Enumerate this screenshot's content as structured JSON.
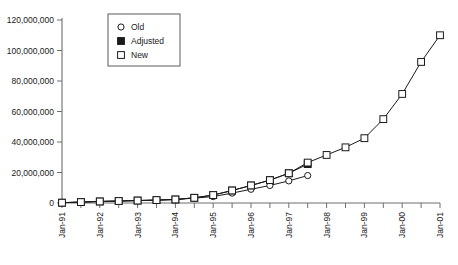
{
  "chart_data": {
    "type": "line",
    "title": "",
    "subtitle": "",
    "xlabel": "",
    "ylabel": "",
    "grid": false,
    "legend_position": "upper-left-inside",
    "ylim": [
      0,
      120000000
    ],
    "ytick_values": [
      0,
      20000000,
      40000000,
      60000000,
      80000000,
      100000000,
      120000000
    ],
    "ytick_labels": [
      "0",
      "20,000,000",
      "40,000,000",
      "60,000,000",
      "80,000,000",
      "100,000,000",
      "120,000,000"
    ],
    "xlim": [
      "Jan-91",
      "Jan-01"
    ],
    "x_tick_interval": "semiannual",
    "xtick_labels": [
      "Jan-91",
      "Jan-92",
      "Jan-93",
      "Jan-94",
      "Jan-95",
      "Jan-96",
      "Jan-97",
      "Jan-98",
      "Jan-99",
      "Jan-00",
      "Jan-01"
    ],
    "x_all_ticks": [
      "Jan-91",
      "Jul-91",
      "Jan-92",
      "Jul-92",
      "Jan-93",
      "Jul-93",
      "Jan-94",
      "Jul-94",
      "Jan-95",
      "Jul-95",
      "Jan-96",
      "Jul-96",
      "Jan-97",
      "Jul-97",
      "Jan-98",
      "Jul-98",
      "Jan-99",
      "Jul-99",
      "Jan-00",
      "Jul-00",
      "Jan-01"
    ],
    "series": [
      {
        "name": "Old",
        "marker": "open-circle",
        "x": [
          "Jan-91",
          "Jul-91",
          "Jan-92",
          "Jul-92",
          "Jan-93",
          "Jul-93",
          "Jan-94",
          "Jul-94",
          "Jan-95",
          "Jul-95",
          "Jan-96",
          "Jul-96",
          "Jan-97",
          "Jul-97"
        ],
        "values": [
          200000,
          600000,
          1000000,
          1300000,
          1600000,
          1900000,
          2300000,
          3200000,
          4200000,
          6500000,
          9000000,
          11500000,
          14500000,
          18000000
        ]
      },
      {
        "name": "Adjusted",
        "marker": "filled-square",
        "x": [
          "Jan-91",
          "Jul-91",
          "Jan-92",
          "Jul-92",
          "Jan-93",
          "Jul-93",
          "Jan-94",
          "Jul-94",
          "Jan-95",
          "Jul-95",
          "Jan-96",
          "Jul-96",
          "Jan-97",
          "Jul-97"
        ],
        "values": [
          200000,
          600000,
          1000000,
          1300000,
          1600000,
          1900000,
          2300000,
          3400000,
          5200000,
          8200000,
          11500000,
          15000000,
          19500000,
          25500000
        ]
      },
      {
        "name": "New",
        "marker": "open-square",
        "x": [
          "Jan-91",
          "Jul-91",
          "Jan-92",
          "Jul-92",
          "Jan-93",
          "Jul-93",
          "Jan-94",
          "Jul-94",
          "Jan-95",
          "Jul-95",
          "Jan-96",
          "Jul-96",
          "Jan-97",
          "Jul-97",
          "Jan-98",
          "Jul-98",
          "Jan-99",
          "Jul-99",
          "Jan-00",
          "Jul-00",
          "Jan-01"
        ],
        "values": [
          200000,
          600000,
          1000000,
          1300000,
          1600000,
          1900000,
          2300000,
          3400000,
          5200000,
          8200000,
          11500000,
          15000000,
          19500000,
          26500000,
          31500000,
          36500000,
          42500000,
          55000000,
          71500000,
          92500000,
          110000000
        ]
      }
    ]
  },
  "legend": {
    "entries": [
      {
        "label": "Old",
        "marker": "open-circle"
      },
      {
        "label": "Adjusted",
        "marker": "filled-square"
      },
      {
        "label": "New",
        "marker": "open-square"
      }
    ]
  },
  "colors": {
    "ink": "#1a1a1a",
    "axis": "#6e6e6e",
    "background": "#ffffff"
  }
}
